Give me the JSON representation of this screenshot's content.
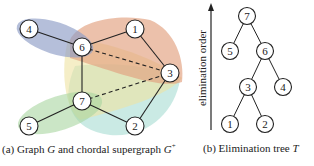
{
  "figure": {
    "graph": {
      "nodes": [
        {
          "id": "4",
          "x": 29,
          "y": 29
        },
        {
          "id": "6",
          "x": 82,
          "y": 47
        },
        {
          "id": "1",
          "x": 135,
          "y": 29
        },
        {
          "id": "3",
          "x": 170,
          "y": 73
        },
        {
          "id": "7",
          "x": 82,
          "y": 101
        },
        {
          "id": "5",
          "x": 29,
          "y": 126
        },
        {
          "id": "2",
          "x": 135,
          "y": 126
        }
      ],
      "edges": [
        [
          "4",
          "6"
        ],
        [
          "6",
          "1"
        ],
        [
          "1",
          "3"
        ],
        [
          "6",
          "7"
        ],
        [
          "7",
          "5"
        ],
        [
          "7",
          "2"
        ],
        [
          "2",
          "3"
        ]
      ],
      "fill_edges": [
        [
          "6",
          "3"
        ],
        [
          "7",
          "3"
        ]
      ],
      "clique_colors": {
        "blue": "#8e9cc6",
        "orange": "#e2a07e",
        "yellow": "#efe2a2",
        "green": "#a9d6a0",
        "teal": "#a6dcd2"
      }
    },
    "tree": {
      "axis_label": "elimination order",
      "nodes": [
        {
          "id": "7",
          "x": 247,
          "y": 16
        },
        {
          "id": "5",
          "x": 230,
          "y": 51
        },
        {
          "id": "6",
          "x": 265,
          "y": 51
        },
        {
          "id": "3",
          "x": 248,
          "y": 87
        },
        {
          "id": "4",
          "x": 283,
          "y": 87
        },
        {
          "id": "1",
          "x": 230,
          "y": 124
        },
        {
          "id": "2",
          "x": 265,
          "y": 124
        }
      ],
      "edges": [
        [
          "7",
          "5"
        ],
        [
          "7",
          "6"
        ],
        [
          "6",
          "3"
        ],
        [
          "6",
          "4"
        ],
        [
          "3",
          "1"
        ],
        [
          "3",
          "2"
        ]
      ]
    },
    "captions": {
      "a": {
        "prefix": "(a) Graph ",
        "g": "G",
        "middle": " and chordal supergraph ",
        "gplus": "G",
        "sup": "+"
      },
      "b": {
        "prefix": "(b) Elimination tree ",
        "t": "T"
      }
    }
  }
}
